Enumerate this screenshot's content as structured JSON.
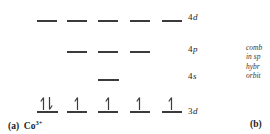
{
  "figure": {
    "type": "orbital-energy-diagram",
    "panel_a_caption": "(a)",
    "ion_symbol": "Co",
    "ion_charge": "3+",
    "panel_b_caption": "(b)",
    "levels": {
      "l4d": {
        "number": "4",
        "letter": "d",
        "orbital_count": 5,
        "electrons": []
      },
      "l4p": {
        "number": "4",
        "letter": "p",
        "orbital_count": 3,
        "electrons": []
      },
      "l4s": {
        "number": "4",
        "letter": "s",
        "orbital_count": 1,
        "electrons": []
      },
      "l3d": {
        "number": "3",
        "letter": "d",
        "orbital_count": 5,
        "electrons": [
          "up-down",
          "up",
          "up",
          "up",
          "up"
        ]
      }
    },
    "side_text": {
      "line1": "comb",
      "line2": "in sp",
      "line3": "hybr",
      "line4": "orbit"
    },
    "colors": {
      "line": "#3b3b3b",
      "text": "#1c1c1c",
      "background": "#ffffff"
    }
  }
}
